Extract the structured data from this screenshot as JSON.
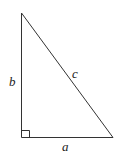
{
  "diagram": {
    "type": "right-triangle",
    "labels": {
      "a": "a",
      "b": "b",
      "c": "c"
    },
    "stroke_color": "#333333",
    "right_angle_marker": true
  }
}
